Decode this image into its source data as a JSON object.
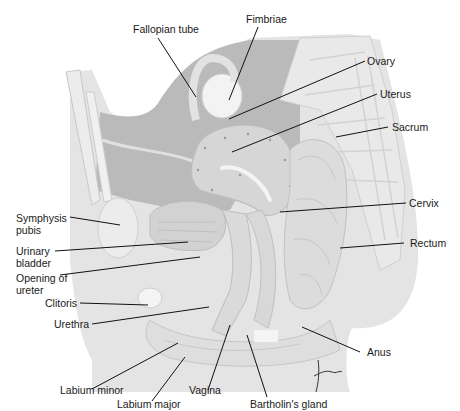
{
  "figure": {
    "signature": "tina",
    "colors": {
      "background": "#ffffff",
      "cavity": "#b9b9b9",
      "tissue_light": "#dedede",
      "tissue_mid": "#cfcfcf",
      "bone": "#e6e6e6",
      "label_text": "#1a1a1a",
      "leader_line": "#111111"
    }
  },
  "labels": {
    "fallopian_tube": "Fallopian tube",
    "fimbriae": "Fimbriae",
    "ovary": "Ovary",
    "uterus": "Uterus",
    "sacrum": "Sacrum",
    "cervix": "Cervix",
    "rectum": "Rectum",
    "symphysis_pubis": "Symphysis pubis",
    "urinary_bladder": "Urinary bladder",
    "opening_of_ureter": "Opening of ureter",
    "clitoris": "Clitoris",
    "urethra": "Urethra",
    "anus": "Anus",
    "labium_minor": "Labium minor",
    "labium_major": "Labium major",
    "vagina": "Vagina",
    "bartholins_gland": "Bartholin's gland"
  }
}
